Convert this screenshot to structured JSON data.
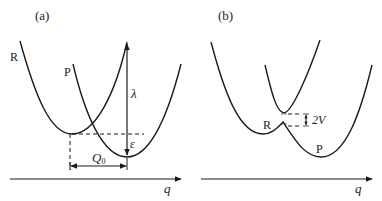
{
  "panels": [
    {
      "id": "a",
      "label": "(a)",
      "curves": [
        {
          "name": "R"
        },
        {
          "name": "P"
        }
      ],
      "annotations": {
        "reorganization_energy": "λ",
        "energy_gap": "ε",
        "displacement": "Q",
        "displacement_sub": "0"
      },
      "axis_label": "q"
    },
    {
      "id": "b",
      "label": "(b)",
      "curves": [
        {
          "name": "R"
        },
        {
          "name": "P"
        }
      ],
      "annotations": {
        "coupling": "2V"
      },
      "axis_label": "q"
    }
  ],
  "colors": {
    "line": "#1a1a1a",
    "background": "#ffffff"
  }
}
